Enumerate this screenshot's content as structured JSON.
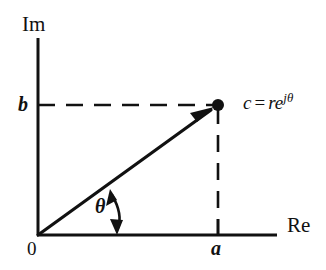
{
  "figure": {
    "background_color": "#ffffff",
    "line_color": "#111111"
  },
  "axes": {
    "imaginary": {
      "label": "Im",
      "orientation": "vertical",
      "x_px": 38,
      "y_top_px": 38,
      "y_bottom_px": 235
    },
    "real": {
      "label": "Re",
      "orientation": "horizontal",
      "y_px": 235,
      "x_left_px": 38,
      "x_right_px": 277
    }
  },
  "origin": {
    "label": "0",
    "x_px": 38,
    "y_px": 235
  },
  "ticks": {
    "real_axis": [
      {
        "label": "a",
        "x_px": 218,
        "y_px": 235
      }
    ],
    "imaginary_axis": [
      {
        "label": "b",
        "x_px": 38,
        "y_px": 105
      }
    ]
  },
  "vector": {
    "from": {
      "x_px": 38,
      "y_px": 235
    },
    "to": {
      "x_px": 218,
      "y_px": 105
    },
    "has_arrowhead": true,
    "endpoint_marker": "filled-dot"
  },
  "angle": {
    "symbol": "θ",
    "marker": "double-headed-curved-arrow",
    "between": [
      "vector",
      "real-axis"
    ]
  },
  "projections": {
    "horizontal_dashed": {
      "from": {
        "x_px": 38,
        "y_px": 105
      },
      "to": {
        "x_px": 218,
        "y_px": 105
      },
      "style": "dashed"
    },
    "vertical_dashed": {
      "from": {
        "x_px": 218,
        "y_px": 105
      },
      "to": {
        "x_px": 218,
        "y_px": 235
      },
      "style": "dashed"
    }
  },
  "point_label": {
    "variable": "c",
    "operator": "=",
    "magnitude": "r",
    "base": "e",
    "exponent": "jθ",
    "full_text": "c = re^{jθ}"
  }
}
